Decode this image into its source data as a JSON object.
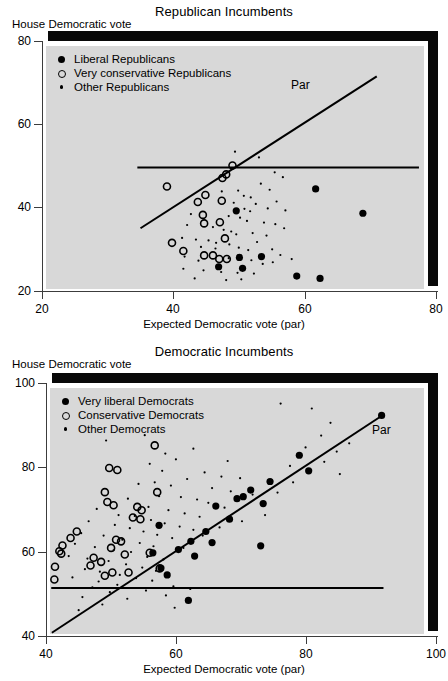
{
  "page": {
    "background": "#ffffff",
    "panel_fill": "#d8d8d8",
    "ink": "#000000"
  },
  "figures": [
    {
      "id": "republican",
      "title": "Republican Incumbents",
      "ylabel": "House Democratic vote",
      "xlabel": "Expected Democratic vote (par)",
      "par_label": "Par",
      "legend": [
        {
          "marker": "filled",
          "label": "Liberal Republicans"
        },
        {
          "marker": "open",
          "label": "Very conservative Republicans"
        },
        {
          "marker": "small",
          "label": "Other Republicans"
        }
      ],
      "xticks": [
        "20",
        "40",
        "60",
        "80"
      ],
      "yticks": [
        "20",
        "40",
        "60",
        "80"
      ]
    },
    {
      "id": "democratic",
      "title": "Democratic Incumbents",
      "ylabel": "House Democratic vote",
      "xlabel": "Expected Democratic vote (par)",
      "par_label": "Par",
      "legend": [
        {
          "marker": "filled",
          "label": "Very liberal Democrats"
        },
        {
          "marker": "open",
          "label": "Conservative Democrats"
        },
        {
          "marker": "small",
          "label": "Other Democrats"
        }
      ],
      "xticks": [
        "40",
        "60",
        "80",
        "100"
      ],
      "yticks": [
        "40",
        "60",
        "80",
        "100"
      ]
    }
  ],
  "chart_data": [
    {
      "type": "scatter",
      "title": "Republican Incumbents",
      "xlabel": "Expected Democratic vote (par)",
      "ylabel": "House Democratic vote",
      "xlim": [
        20,
        80
      ],
      "ylim": [
        20,
        80
      ],
      "xticks": [
        20,
        40,
        60,
        80
      ],
      "yticks": [
        20,
        40,
        60,
        80
      ],
      "grid": false,
      "legend_position": "upper-left",
      "annotations": [
        {
          "text": "Par",
          "x": 64.5,
          "y": 66.5
        }
      ],
      "reference_lines": [
        {
          "name": "par-diagonal",
          "type": "segment",
          "x0": 35.0,
          "y0": 35.0,
          "x1": 72.5,
          "y1": 72.5
        },
        {
          "name": "fifty-percent-horizontal",
          "type": "segment",
          "x0": 34.5,
          "y0": 50.0,
          "x1": 79.2,
          "y1": 50.0
        }
      ],
      "series": [
        {
          "name": "Liberal Republicans",
          "marker": "filled-circle",
          "size": 7.2,
          "points": [
            [
              50.2,
              39.3
            ],
            [
              62.8,
              44.7
            ],
            [
              70.3,
              38.7
            ],
            [
              50.7,
              27.8
            ],
            [
              54.2,
              28.0
            ],
            [
              47.4,
              25.5
            ],
            [
              51.2,
              25.1
            ],
            [
              59.8,
              23.2
            ],
            [
              63.5,
              22.6
            ]
          ]
        },
        {
          "name": "Very conservative Republicans",
          "marker": "open-circle",
          "size": 7.0,
          "points": [
            [
              49.6,
              50.5
            ],
            [
              48.0,
              47.4
            ],
            [
              48.6,
              48.3
            ],
            [
              39.2,
              45.3
            ],
            [
              45.3,
              43.2
            ],
            [
              44.1,
              41.5
            ],
            [
              47.9,
              41.8
            ],
            [
              44.9,
              38.3
            ],
            [
              45.1,
              36.2
            ],
            [
              47.6,
              36.5
            ],
            [
              48.4,
              32.5
            ],
            [
              40.0,
              31.4
            ],
            [
              41.8,
              29.4
            ],
            [
              45.1,
              28.3
            ],
            [
              46.5,
              28.3
            ],
            [
              47.5,
              27.4
            ],
            [
              48.7,
              27.4
            ]
          ]
        },
        {
          "name": "Other Republicans",
          "marker": "small-dot",
          "size": 2.2,
          "points": [
            [
              50.0,
              53.9
            ],
            [
              53.8,
              52.5
            ],
            [
              56.3,
              48.8
            ],
            [
              57.6,
              47.6
            ],
            [
              54.1,
              46.0
            ],
            [
              55.5,
              44.5
            ],
            [
              50.5,
              44.3
            ],
            [
              47.9,
              44.1
            ],
            [
              51.4,
              43.0
            ],
            [
              52.5,
              42.6
            ],
            [
              49.8,
              41.3
            ],
            [
              53.3,
              41.0
            ],
            [
              56.6,
              41.6
            ],
            [
              51.5,
              39.8
            ],
            [
              52.4,
              39.2
            ],
            [
              55.2,
              39.9
            ],
            [
              58.0,
              39.4
            ],
            [
              43.0,
              38.5
            ],
            [
              49.0,
              38.0
            ],
            [
              50.8,
              37.6
            ],
            [
              51.9,
              36.8
            ],
            [
              54.6,
              36.4
            ],
            [
              56.4,
              36.0
            ],
            [
              57.8,
              35.0
            ],
            [
              42.4,
              35.8
            ],
            [
              46.5,
              35.3
            ],
            [
              48.2,
              34.6
            ],
            [
              49.4,
              34.2
            ],
            [
              50.2,
              33.5
            ],
            [
              52.8,
              33.8
            ],
            [
              55.0,
              33.2
            ],
            [
              41.6,
              32.6
            ],
            [
              43.8,
              32.2
            ],
            [
              45.8,
              32.0
            ],
            [
              47.0,
              31.4
            ],
            [
              49.1,
              31.0
            ],
            [
              53.5,
              31.6
            ],
            [
              44.6,
              30.4
            ],
            [
              46.9,
              30.0
            ],
            [
              50.6,
              30.2
            ],
            [
              52.1,
              29.6
            ],
            [
              55.9,
              29.8
            ],
            [
              57.2,
              28.4
            ],
            [
              42.0,
              28.0
            ],
            [
              44.2,
              27.0
            ],
            [
              49.0,
              27.6
            ],
            [
              52.6,
              27.1
            ],
            [
              54.4,
              26.2
            ],
            [
              56.0,
              26.6
            ],
            [
              59.0,
              27.4
            ],
            [
              41.8,
              25.0
            ],
            [
              45.0,
              24.6
            ],
            [
              47.8,
              24.2
            ],
            [
              50.4,
              24.0
            ],
            [
              53.0,
              23.8
            ],
            [
              43.6,
              22.6
            ],
            [
              48.6,
              22.2
            ],
            [
              51.0,
              22.4
            ]
          ]
        }
      ]
    },
    {
      "type": "scatter",
      "title": "Democratic Incumbents",
      "xlabel": "Expected Democratic vote (par)",
      "ylabel": "House Democratic vote",
      "xlim": [
        40,
        100
      ],
      "ylim": [
        40,
        100
      ],
      "xticks": [
        40,
        60,
        80,
        100
      ],
      "yticks": [
        40,
        60,
        80,
        100
      ],
      "grid": false,
      "legend_position": "upper-left",
      "annotations": [
        {
          "text": "Par",
          "x": 89.5,
          "y": 83.0
        }
      ],
      "reference_lines": [
        {
          "name": "par-diagonal",
          "type": "segment",
          "x0": 40.3,
          "y0": 40.3,
          "x1": 93.6,
          "y1": 93.6
        },
        {
          "name": "fifty-percent-horizontal",
          "type": "segment",
          "x0": 40.2,
          "y0": 51.2,
          "x1": 93.5,
          "y1": 51.2
        }
      ],
      "series": [
        {
          "name": "Very liberal Democrats",
          "marker": "filled-circle",
          "size": 7.2,
          "points": [
            [
              93.2,
              93.3
            ],
            [
              80.0,
              83.6
            ],
            [
              81.5,
              79.8
            ],
            [
              75.3,
              77.2
            ],
            [
              72.2,
              75.1
            ],
            [
              71.0,
              73.5
            ],
            [
              70.0,
              73.0
            ],
            [
              74.2,
              71.8
            ],
            [
              66.6,
              71.2
            ],
            [
              68.8,
              68.0
            ],
            [
              65.0,
              65.0
            ],
            [
              57.5,
              66.5
            ],
            [
              62.6,
              62.6
            ],
            [
              66.0,
              62.3
            ],
            [
              73.8,
              61.5
            ],
            [
              60.6,
              60.6
            ],
            [
              56.5,
              59.8
            ],
            [
              63.2,
              59.0
            ],
            [
              57.8,
              56.1
            ],
            [
              58.8,
              54.4
            ],
            [
              62.2,
              48.2
            ]
          ]
        },
        {
          "name": "Conservative Democrats",
          "marker": "open-circle",
          "size": 7.0,
          "points": [
            [
              56.8,
              86.0
            ],
            [
              49.5,
              80.5
            ],
            [
              50.8,
              80.0
            ],
            [
              48.8,
              74.6
            ],
            [
              57.2,
              74.6
            ],
            [
              49.2,
              72.2
            ],
            [
              50.2,
              71.4
            ],
            [
              54.0,
              71.0
            ],
            [
              54.7,
              70.2
            ],
            [
              53.3,
              68.4
            ],
            [
              54.5,
              68.0
            ],
            [
              44.3,
              65.0
            ],
            [
              43.3,
              63.4
            ],
            [
              50.6,
              63.0
            ],
            [
              51.4,
              62.6
            ],
            [
              42.0,
              61.6
            ],
            [
              49.8,
              61.0
            ],
            [
              41.5,
              60.2
            ],
            [
              41.8,
              59.6
            ],
            [
              52.0,
              59.4
            ],
            [
              56.0,
              59.8
            ],
            [
              47.0,
              58.6
            ],
            [
              48.2,
              57.6
            ],
            [
              46.5,
              56.7
            ],
            [
              40.8,
              56.4
            ],
            [
              50.0,
              55.0
            ],
            [
              52.6,
              55.0
            ],
            [
              57.6,
              56.0
            ],
            [
              40.7,
              53.3
            ],
            [
              48.8,
              54.2
            ]
          ]
        },
        {
          "name": "Other Democrats",
          "marker": "small-dot",
          "size": 2.2,
          "points": [
            [
              77.0,
              96.2
            ],
            [
              82.0,
              95.0
            ],
            [
              85.0,
              91.5
            ],
            [
              83.5,
              88.4
            ],
            [
              88.0,
              86.5
            ],
            [
              81.0,
              85.5
            ],
            [
              63.0,
              85.2
            ],
            [
              58.5,
              84.0
            ],
            [
              60.2,
              82.6
            ],
            [
              68.5,
              82.2
            ],
            [
              86.5,
              79.0
            ],
            [
              78.5,
              81.0
            ],
            [
              55.2,
              88.5
            ],
            [
              49.0,
              87.2
            ],
            [
              56.0,
              81.5
            ],
            [
              58.0,
              79.8
            ],
            [
              64.8,
              79.4
            ],
            [
              67.5,
              78.4
            ],
            [
              70.5,
              78.0
            ],
            [
              62.0,
              77.8
            ],
            [
              56.8,
              77.0
            ],
            [
              59.4,
              76.2
            ],
            [
              66.0,
              75.6
            ],
            [
              69.0,
              74.8
            ],
            [
              72.5,
              74.0
            ],
            [
              54.2,
              76.6
            ],
            [
              57.5,
              73.6
            ],
            [
              61.0,
              73.4
            ],
            [
              63.6,
              72.8
            ],
            [
              65.4,
              72.0
            ],
            [
              68.0,
              70.8
            ],
            [
              52.5,
              73.0
            ],
            [
              55.8,
              71.0
            ],
            [
              59.0,
              70.2
            ],
            [
              61.6,
              69.4
            ],
            [
              64.0,
              68.6
            ],
            [
              47.5,
              70.5
            ],
            [
              51.0,
              69.0
            ],
            [
              53.6,
              68.8
            ],
            [
              56.2,
              67.8
            ],
            [
              58.4,
              67.0
            ],
            [
              60.8,
              66.2
            ],
            [
              63.0,
              65.4
            ],
            [
              46.2,
              67.5
            ],
            [
              50.4,
              66.6
            ],
            [
              52.8,
              65.8
            ],
            [
              55.0,
              65.0
            ],
            [
              57.2,
              64.2
            ],
            [
              59.6,
              63.4
            ],
            [
              45.0,
              64.6
            ],
            [
              48.6,
              64.0
            ],
            [
              51.6,
              63.0
            ],
            [
              54.4,
              62.2
            ],
            [
              56.6,
              61.4
            ],
            [
              61.4,
              61.0
            ],
            [
              44.0,
              62.0
            ],
            [
              47.2,
              61.2
            ],
            [
              50.2,
              60.4
            ],
            [
              53.0,
              60.0
            ],
            [
              55.6,
              58.8
            ],
            [
              58.2,
              58.2
            ],
            [
              43.0,
              59.0
            ],
            [
              46.0,
              58.4
            ],
            [
              49.4,
              57.8
            ],
            [
              52.2,
              57.0
            ],
            [
              54.8,
              56.2
            ],
            [
              57.0,
              55.4
            ],
            [
              45.6,
              55.8
            ],
            [
              48.0,
              55.2
            ],
            [
              51.2,
              54.4
            ],
            [
              53.8,
              53.6
            ],
            [
              56.4,
              53.0
            ],
            [
              43.6,
              53.8
            ],
            [
              47.8,
              52.8
            ],
            [
              50.8,
              52.0
            ],
            [
              59.8,
              51.6
            ],
            [
              62.5,
              51.0
            ],
            [
              46.8,
              51.4
            ],
            [
              49.6,
              50.2
            ],
            [
              55.4,
              50.6
            ],
            [
              58.6,
              49.4
            ],
            [
              45.2,
              49.0
            ],
            [
              52.4,
              48.6
            ],
            [
              48.4,
              47.2
            ],
            [
              44.6,
              45.8
            ],
            [
              60.0,
              46.4
            ],
            [
              64.5,
              64.0
            ],
            [
              67.2,
              66.0
            ],
            [
              70.8,
              67.5
            ],
            [
              74.5,
              69.0
            ],
            [
              76.5,
              74.5
            ],
            [
              79.0,
              77.0
            ],
            [
              84.0,
              82.0
            ],
            [
              86.0,
              84.5
            ]
          ]
        }
      ]
    }
  ]
}
